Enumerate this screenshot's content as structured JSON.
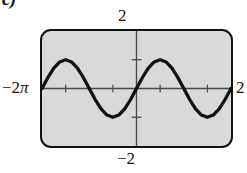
{
  "figure": {
    "part_label": "c)",
    "labels": {
      "y_max": "2",
      "y_min": "−2",
      "x_min_number": "−2",
      "x_min_symbol": "π",
      "x_max": "2"
    }
  },
  "chart_data": {
    "type": "line",
    "title": "",
    "subtitle": "",
    "xlabel": "",
    "ylabel": "",
    "grid": false,
    "legend": null,
    "axis_style": "graphing-calculator-window",
    "xlim": [
      -6.283185307,
      6.283185307
    ],
    "ylim": [
      -2,
      2
    ],
    "x_tick_labels": [
      "−2π",
      "2"
    ],
    "y_tick_labels": [
      "2",
      "−2"
    ],
    "x_ticks": [
      -4.71238898,
      -1.570796327,
      1.570796327,
      4.71238898
    ],
    "y_ticks": [
      -1,
      1
    ],
    "x_axis_position": 0,
    "y_axis_position": 0,
    "series": [
      {
        "name": "y = sin(x)",
        "equation": "y = sin x",
        "amplitude": 1,
        "period": 6.283185307,
        "x": [
          -6.283185307,
          -5.890486225,
          -5.497787144,
          -5.105088062,
          -4.71238898,
          -4.319689899,
          -3.926990817,
          -3.534291735,
          -3.141592654,
          -2.748893572,
          -2.35619449,
          -1.963495408,
          -1.570796327,
          -1.178097245,
          -0.785398163,
          -0.392699082,
          0,
          0.392699082,
          0.785398163,
          1.178097245,
          1.570796327,
          1.963495408,
          2.35619449,
          2.748893572,
          3.141592654,
          3.534291735,
          3.926990817,
          4.319689899,
          4.71238898,
          5.105088062,
          5.497787144,
          5.890486225,
          6.283185307
        ],
        "y": [
          0,
          0.382683432,
          0.707106781,
          0.923879533,
          1,
          0.923879533,
          0.707106781,
          0.382683432,
          0,
          -0.382683432,
          -0.707106781,
          -0.923879533,
          -1,
          -0.923879533,
          -0.707106781,
          -0.382683432,
          0,
          0.382683432,
          0.707106781,
          0.923879533,
          1,
          0.923879533,
          0.707106781,
          0.382683432,
          0,
          -0.382683432,
          -0.707106781,
          -0.923879533,
          -1,
          -0.923879533,
          -0.707106781,
          -0.382683432,
          0
        ]
      }
    ],
    "colors": {
      "curve": "#111111",
      "axis": "#4a4a4a",
      "window_fill": "#d9d9d9",
      "window_border": "#121212"
    }
  }
}
